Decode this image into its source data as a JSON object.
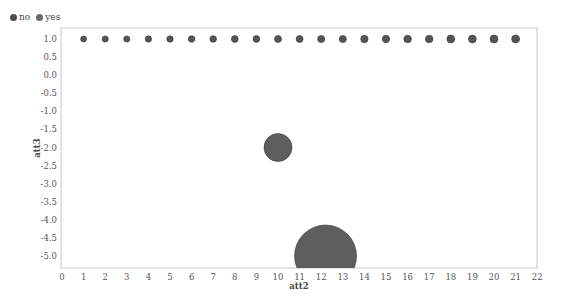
{
  "chart_data": {
    "type": "scatter",
    "title": "",
    "xlabel": "att2",
    "ylabel": "att3",
    "xlim": [
      0,
      22
    ],
    "ylim": [
      -5.2,
      1.2
    ],
    "x_ticks": [
      "0",
      "1",
      "2",
      "3",
      "4",
      "5",
      "6",
      "7",
      "8",
      "9",
      "10",
      "11",
      "12",
      "13",
      "14",
      "15",
      "16",
      "17",
      "18",
      "19",
      "20",
      "21",
      "22"
    ],
    "y_ticks": [
      "1.0",
      "0.5",
      "0.0",
      "-0.5",
      "-1.0",
      "-1.5",
      "-2.0",
      "-2.5",
      "-3.0",
      "-3.5",
      "-4.0",
      "-4.5",
      "-5.0"
    ],
    "legend": [
      {
        "label": "no",
        "color": "#4a4a4a"
      },
      {
        "label": "yes",
        "color": "#6a6a6a"
      }
    ],
    "legend_position": "top-left",
    "grid": false,
    "series": [
      {
        "name": "no",
        "color": "#555555",
        "points": [
          {
            "x": 1,
            "y": 1.0,
            "r": 3.0
          },
          {
            "x": 2,
            "y": 1.0,
            "r": 3.1
          },
          {
            "x": 3,
            "y": 1.0,
            "r": 3.1
          },
          {
            "x": 4,
            "y": 1.0,
            "r": 3.2
          },
          {
            "x": 5,
            "y": 1.0,
            "r": 3.2
          },
          {
            "x": 6,
            "y": 1.0,
            "r": 3.3
          },
          {
            "x": 7,
            "y": 1.0,
            "r": 3.3
          },
          {
            "x": 8,
            "y": 1.0,
            "r": 3.4
          },
          {
            "x": 9,
            "y": 1.0,
            "r": 3.4
          },
          {
            "x": 10,
            "y": 1.0,
            "r": 3.5
          },
          {
            "x": 11,
            "y": 1.0,
            "r": 3.5
          },
          {
            "x": 12,
            "y": 1.0,
            "r": 3.6
          },
          {
            "x": 13,
            "y": 1.0,
            "r": 3.6
          },
          {
            "x": 14,
            "y": 1.0,
            "r": 3.7
          },
          {
            "x": 15,
            "y": 1.0,
            "r": 3.7
          },
          {
            "x": 16,
            "y": 1.0,
            "r": 3.8
          },
          {
            "x": 17,
            "y": 1.0,
            "r": 3.8
          },
          {
            "x": 18,
            "y": 1.0,
            "r": 3.9
          },
          {
            "x": 19,
            "y": 1.0,
            "r": 3.9
          },
          {
            "x": 20,
            "y": 1.0,
            "r": 4.0
          },
          {
            "x": 21,
            "y": 1.0,
            "r": 4.0
          }
        ]
      },
      {
        "name": "yes",
        "color": "#5e5e5e",
        "points": [
          {
            "x": 10,
            "y": -2.0,
            "r": 14
          },
          {
            "x": 12.2,
            "y": -5.0,
            "r": 31
          }
        ]
      }
    ]
  }
}
